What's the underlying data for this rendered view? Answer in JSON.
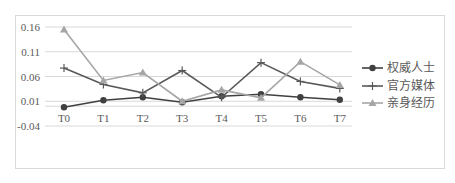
{
  "chart_data": {
    "type": "line",
    "title": "",
    "xlabel": "",
    "ylabel": "",
    "categories": [
      "T0",
      "T1",
      "T2",
      "T3",
      "T4",
      "T5",
      "T6",
      "T7"
    ],
    "y_ticks": [
      "0.16",
      "0.11",
      "0.06",
      "0.01",
      "-0.04"
    ],
    "ylim": [
      -0.04,
      0.16
    ],
    "grid": true,
    "legend_position": "right",
    "series": [
      {
        "name": "权威人士",
        "marker": "circle",
        "color": "#404040",
        "values": [
          -0.002,
          0.012,
          0.018,
          0.008,
          0.02,
          0.024,
          0.018,
          0.013
        ]
      },
      {
        "name": "官方媒体",
        "marker": "plus",
        "color": "#595959",
        "values": [
          0.077,
          0.044,
          0.027,
          0.072,
          0.018,
          0.088,
          0.05,
          0.036
        ]
      },
      {
        "name": "亲身经历",
        "marker": "triangle",
        "color": "#a6a6a6",
        "values": [
          0.155,
          0.052,
          0.068,
          0.01,
          0.033,
          0.017,
          0.09,
          0.043
        ]
      }
    ]
  }
}
